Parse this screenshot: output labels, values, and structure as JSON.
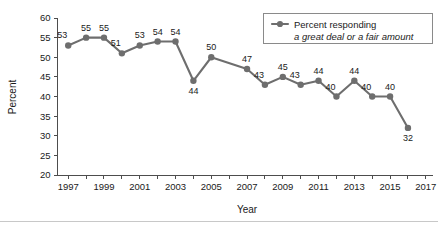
{
  "chart_data": {
    "type": "line",
    "title": "",
    "xlabel": "Year",
    "ylabel": "Percent",
    "xlim": [
      1996.4,
      2017.4
    ],
    "ylim": [
      20,
      60
    ],
    "ytick_step": 5,
    "yticks": [
      20,
      25,
      30,
      35,
      40,
      45,
      50,
      55,
      60
    ],
    "ytick_labels": [
      "20",
      "25",
      "30",
      "35",
      "40",
      "45",
      "50",
      "55",
      "60"
    ],
    "xticks": [
      1997,
      1998,
      1999,
      2000,
      2001,
      2002,
      2003,
      2004,
      2005,
      2006,
      2007,
      2008,
      2009,
      2010,
      2011,
      2012,
      2013,
      2014,
      2015,
      2016,
      2017
    ],
    "xtick_labels": [
      "1997",
      "",
      "1999",
      "",
      "2001",
      "",
      "2003",
      "",
      "2005",
      "",
      "2007",
      "",
      "2009",
      "",
      "2011",
      "",
      "2013",
      "",
      "2015",
      "",
      "2017"
    ],
    "grid": false,
    "legend_position": "top-right",
    "series": [
      {
        "name": "Percent responding a great deal or a fair amount",
        "color": "#6e6e6e",
        "marker": "circle",
        "points": [
          {
            "x": 1997,
            "y": 53,
            "label": "53",
            "label_pos": "above-left"
          },
          {
            "x": 1998,
            "y": 55,
            "label": "55",
            "label_pos": "above"
          },
          {
            "x": 1999,
            "y": 55,
            "label": "55",
            "label_pos": "above"
          },
          {
            "x": 2000,
            "y": 51,
            "label": "51",
            "label_pos": "above-left"
          },
          {
            "x": 2001,
            "y": 53,
            "label": "53",
            "label_pos": "above"
          },
          {
            "x": 2002,
            "y": 54,
            "label": "54",
            "label_pos": "above"
          },
          {
            "x": 2003,
            "y": 54,
            "label": "54",
            "label_pos": "above"
          },
          {
            "x": 2004,
            "y": 44,
            "label": "44",
            "label_pos": "below"
          },
          {
            "x": 2005,
            "y": 50,
            "label": "50",
            "label_pos": "above"
          },
          {
            "x": 2007,
            "y": 47,
            "label": "47",
            "label_pos": "above"
          },
          {
            "x": 2008,
            "y": 43,
            "label": "43",
            "label_pos": "above-left"
          },
          {
            "x": 2009,
            "y": 45,
            "label": "45",
            "label_pos": "above"
          },
          {
            "x": 2010,
            "y": 43,
            "label": "43",
            "label_pos": "above-left"
          },
          {
            "x": 2011,
            "y": 44,
            "label": "44",
            "label_pos": "above"
          },
          {
            "x": 2012,
            "y": 40,
            "label": "40",
            "label_pos": "above-left"
          },
          {
            "x": 2013,
            "y": 44,
            "label": "44",
            "label_pos": "above"
          },
          {
            "x": 2014,
            "y": 40,
            "label": "40",
            "label_pos": "above-left"
          },
          {
            "x": 2015,
            "y": 40,
            "label": "40",
            "label_pos": "above"
          },
          {
            "x": 2016,
            "y": 32,
            "label": "32",
            "label_pos": "below"
          }
        ]
      }
    ]
  },
  "legend": {
    "line1": "Percent responding",
    "line2": "a great deal or a fair amount",
    "marker_color": "#6e6e6e"
  },
  "axes": {
    "y_title": "Percent",
    "x_title": "Year"
  }
}
